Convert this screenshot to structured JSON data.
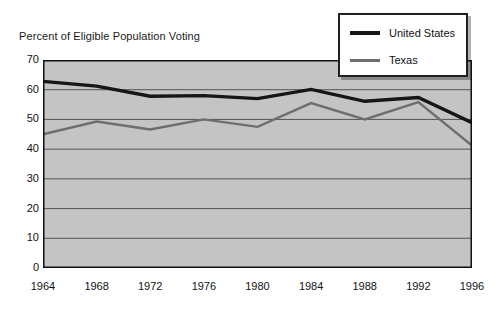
{
  "chart_data": {
    "type": "line",
    "title": "Percent of Eligible Population Voting",
    "xlabel": "",
    "ylabel": "",
    "categories": [
      "1964",
      "1968",
      "1972",
      "1976",
      "1980",
      "1984",
      "1988",
      "1992",
      "1996"
    ],
    "x": [
      1964,
      1968,
      1972,
      1976,
      1980,
      1984,
      1988,
      1992,
      1996
    ],
    "series": [
      {
        "name": "United States",
        "color": "#161616",
        "values": [
          62.8,
          61.2,
          57.8,
          58.0,
          57.0,
          60.1,
          56.1,
          57.4,
          48.9
        ]
      },
      {
        "name": "Texas",
        "color": "#6e6e6e",
        "values": [
          45.0,
          49.3,
          46.6,
          50.0,
          47.5,
          55.5,
          50.0,
          55.8,
          41.2
        ]
      }
    ],
    "ylim": [
      0,
      70
    ],
    "yticks": [
      0,
      10,
      20,
      30,
      40,
      50,
      60,
      70
    ],
    "ytick_labels": [
      "0",
      "10",
      "20",
      "30",
      "40",
      "50",
      "60",
      "70"
    ],
    "grid": true,
    "grid_axis": "y",
    "legend_position": "top-right",
    "plot_background": "#c4c4c4",
    "grid_color": "#555555",
    "axis_color": "#111111"
  },
  "legend": {
    "entries": [
      {
        "label": "United States",
        "color": "#161616",
        "thickness": 4
      },
      {
        "label": "Texas",
        "color": "#6e6e6e",
        "thickness": 3
      }
    ]
  }
}
